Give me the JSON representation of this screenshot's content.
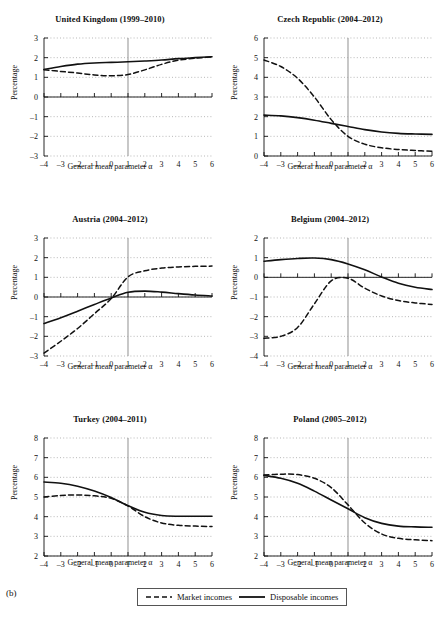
{
  "figure": {
    "label": "(b)",
    "axis_x_label": "General mean parameter α",
    "axis_y_label": "Percentage"
  },
  "legend": {
    "items": [
      {
        "name": "Market incomes",
        "style": "dashed"
      },
      {
        "name": "Disposable incomes",
        "style": "solid"
      }
    ]
  },
  "chart_data": [
    {
      "type": "line",
      "title": "United Kingdom (1999–2010)",
      "xlabel": "General mean parameter α",
      "ylabel": "Percentage",
      "xlim": [
        -4,
        6
      ],
      "ylim": [
        -3,
        3
      ],
      "xticks": [
        -4,
        -3,
        -2,
        -1,
        0,
        1,
        2,
        3,
        4,
        5,
        6
      ],
      "yticks": [
        -3,
        -2,
        -1,
        0,
        1,
        2,
        3
      ],
      "grid": true,
      "x": [
        -4,
        -3,
        -2,
        -1,
        0,
        1,
        2,
        3,
        4,
        5,
        6
      ],
      "series": [
        {
          "name": "Market incomes",
          "style": "dashed",
          "values": [
            1.38,
            1.3,
            1.22,
            1.12,
            1.08,
            1.14,
            1.38,
            1.66,
            1.87,
            1.97,
            2.04
          ]
        },
        {
          "name": "Disposable incomes",
          "style": "solid",
          "values": [
            1.4,
            1.55,
            1.67,
            1.73,
            1.76,
            1.79,
            1.83,
            1.88,
            1.95,
            2.0,
            2.05
          ]
        }
      ]
    },
    {
      "type": "line",
      "title": "Czech Republic (2004–2012)",
      "xlabel": "General mean parameter α",
      "ylabel": "Percentage",
      "xlim": [
        -4,
        6
      ],
      "ylim": [
        0,
        6
      ],
      "xticks": [
        -4,
        -3,
        -2,
        -1,
        0,
        1,
        2,
        3,
        4,
        5,
        6
      ],
      "yticks": [
        0,
        1,
        2,
        3,
        4,
        5,
        6
      ],
      "grid": true,
      "x": [
        -4,
        -3,
        -2,
        -1,
        0,
        1,
        2,
        3,
        4,
        5,
        6
      ],
      "series": [
        {
          "name": "Market incomes",
          "style": "dashed",
          "values": [
            4.88,
            4.55,
            3.95,
            3.0,
            1.85,
            1.0,
            0.6,
            0.42,
            0.33,
            0.28,
            0.24
          ]
        },
        {
          "name": "Disposable incomes",
          "style": "solid",
          "values": [
            2.08,
            2.04,
            1.95,
            1.82,
            1.66,
            1.5,
            1.34,
            1.22,
            1.15,
            1.12,
            1.1
          ]
        }
      ]
    },
    {
      "type": "line",
      "title": "Austria (2004–2012)",
      "xlabel": "General mean parameter α",
      "ylabel": "Percentage",
      "xlim": [
        -4,
        6
      ],
      "ylim": [
        -3,
        3
      ],
      "xticks": [
        -4,
        -3,
        -2,
        -1,
        0,
        1,
        2,
        3,
        4,
        5,
        6
      ],
      "yticks": [
        -3,
        -2,
        -1,
        0,
        1,
        2,
        3
      ],
      "grid": true,
      "x": [
        -4,
        -3,
        -2,
        -1,
        0,
        1,
        2,
        3,
        4,
        5,
        6
      ],
      "series": [
        {
          "name": "Market incomes",
          "style": "dashed",
          "values": [
            -2.85,
            -2.25,
            -1.6,
            -0.85,
            -0.08,
            1.02,
            1.33,
            1.47,
            1.53,
            1.56,
            1.57
          ]
        },
        {
          "name": "Disposable incomes",
          "style": "solid",
          "values": [
            -1.35,
            -1.05,
            -0.72,
            -0.38,
            -0.05,
            0.24,
            0.3,
            0.25,
            0.17,
            0.1,
            0.05
          ]
        }
      ]
    },
    {
      "type": "line",
      "title": "Belgium (2004–2012)",
      "xlabel": "General mean parameter α",
      "ylabel": "Percentage",
      "xlim": [
        -4,
        6
      ],
      "ylim": [
        -4,
        2
      ],
      "xticks": [
        -4,
        -3,
        -2,
        -1,
        0,
        1,
        2,
        3,
        4,
        5,
        6
      ],
      "yticks": [
        -4,
        -3,
        -2,
        -1,
        0,
        1,
        2
      ],
      "grid": true,
      "x": [
        -4,
        -3,
        -2,
        -1,
        0,
        1,
        2,
        3,
        4,
        5,
        6
      ],
      "series": [
        {
          "name": "Market incomes",
          "style": "dashed",
          "values": [
            -3.1,
            -3.0,
            -2.55,
            -1.35,
            -0.18,
            -0.05,
            -0.55,
            -0.95,
            -1.18,
            -1.3,
            -1.38
          ]
        },
        {
          "name": "Disposable incomes",
          "style": "solid",
          "values": [
            0.82,
            0.9,
            0.96,
            0.98,
            0.9,
            0.68,
            0.38,
            0.02,
            -0.3,
            -0.5,
            -0.62
          ]
        }
      ]
    },
    {
      "type": "line",
      "title": "Turkey (2004–2011)",
      "xlabel": "General mean parameter α",
      "ylabel": "Percentage",
      "xlim": [
        -4,
        6
      ],
      "ylim": [
        2,
        8
      ],
      "xticks": [
        -4,
        -3,
        -2,
        -1,
        0,
        1,
        2,
        3,
        4,
        5,
        6
      ],
      "yticks": [
        2,
        3,
        4,
        5,
        6,
        7,
        8
      ],
      "grid": true,
      "x": [
        -4,
        -3,
        -2,
        -1,
        0,
        1,
        2,
        3,
        4,
        5,
        6
      ],
      "series": [
        {
          "name": "Market incomes",
          "style": "dashed",
          "values": [
            5.0,
            5.08,
            5.1,
            5.06,
            4.93,
            4.55,
            4.0,
            3.68,
            3.56,
            3.52,
            3.5
          ]
        },
        {
          "name": "Disposable incomes",
          "style": "solid",
          "values": [
            5.76,
            5.7,
            5.55,
            5.3,
            4.97,
            4.56,
            4.22,
            4.06,
            4.02,
            4.02,
            4.02
          ]
        }
      ]
    },
    {
      "type": "line",
      "title": "Poland (2005–2012)",
      "xlabel": "General mean parameter α",
      "ylabel": "Percentage",
      "xlim": [
        -4,
        6
      ],
      "ylim": [
        2,
        8
      ],
      "xticks": [
        -4,
        -3,
        -2,
        -1,
        0,
        1,
        2,
        3,
        4,
        5,
        6
      ],
      "yticks": [
        2,
        3,
        4,
        5,
        6,
        7,
        8
      ],
      "grid": true,
      "x": [
        -4,
        -3,
        -2,
        -1,
        0,
        1,
        2,
        3,
        4,
        5,
        6
      ],
      "series": [
        {
          "name": "Market incomes",
          "style": "dashed",
          "values": [
            6.12,
            6.16,
            6.14,
            5.95,
            5.48,
            4.6,
            3.68,
            3.12,
            2.9,
            2.82,
            2.78
          ]
        },
        {
          "name": "Disposable incomes",
          "style": "solid",
          "values": [
            6.1,
            5.95,
            5.7,
            5.3,
            4.85,
            4.4,
            3.95,
            3.66,
            3.52,
            3.48,
            3.46
          ]
        }
      ]
    }
  ]
}
